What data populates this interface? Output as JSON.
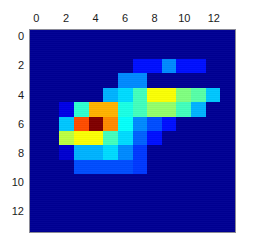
{
  "figure": {
    "background_color": "#ffffff",
    "axes_border_color": "#8a8a96",
    "tick_label_color": "#1b1b1b"
  },
  "axes": {
    "x_tick_labels": [
      "0",
      "2",
      "4",
      "6",
      "8",
      "10",
      "12"
    ],
    "x_tick_values": [
      0,
      2,
      4,
      6,
      8,
      10,
      12
    ],
    "x_tick_position": "top",
    "y_tick_labels": [
      "0",
      "2",
      "4",
      "6",
      "8",
      "10",
      "12"
    ],
    "y_tick_values": [
      0,
      2,
      4,
      6,
      8,
      10,
      12
    ],
    "y_tick_position": "left"
  },
  "chart_data": {
    "type": "heatmap",
    "title": "",
    "xlabel": "",
    "ylabel": "",
    "colormap": "jet",
    "origin": "upper",
    "grid": false,
    "legend": "none",
    "xlim": [
      -0.5,
      13.5
    ],
    "ylim": [
      13.5,
      -0.5
    ],
    "vmin": 0,
    "vmax": 1,
    "x": [
      0,
      1,
      2,
      3,
      4,
      5,
      6,
      7,
      8,
      9,
      10,
      11,
      12,
      13
    ],
    "y": [
      0,
      1,
      2,
      3,
      4,
      5,
      6,
      7,
      8,
      9,
      10,
      11,
      12,
      13
    ],
    "xtick_labels": [
      "0",
      "2",
      "4",
      "6",
      "8",
      "10",
      "12"
    ],
    "ytick_labels": [
      "0",
      "2",
      "4",
      "6",
      "8",
      "10",
      "12"
    ],
    "peak_cell": {
      "x": 4,
      "y": 6,
      "value": 1.0
    },
    "values": [
      [
        0.02,
        0.02,
        0.02,
        0.02,
        0.02,
        0.02,
        0.02,
        0.02,
        0.02,
        0.02,
        0.02,
        0.02,
        0.02,
        0.02
      ],
      [
        0.02,
        0.02,
        0.02,
        0.02,
        0.02,
        0.02,
        0.02,
        0.02,
        0.02,
        0.02,
        0.02,
        0.02,
        0.02,
        0.02
      ],
      [
        0.02,
        0.02,
        0.02,
        0.02,
        0.02,
        0.02,
        0.02,
        0.14,
        0.14,
        0.26,
        0.14,
        0.14,
        0.02,
        0.02
      ],
      [
        0.02,
        0.02,
        0.02,
        0.02,
        0.02,
        0.02,
        0.26,
        0.26,
        0.02,
        0.02,
        0.02,
        0.02,
        0.02,
        0.02
      ],
      [
        0.02,
        0.02,
        0.02,
        0.02,
        0.02,
        0.3,
        0.34,
        0.44,
        0.62,
        0.62,
        0.5,
        0.46,
        0.32,
        0.02
      ],
      [
        0.02,
        0.02,
        0.1,
        0.42,
        0.7,
        0.7,
        0.4,
        0.44,
        0.52,
        0.52,
        0.44,
        0.3,
        0.02,
        0.02
      ],
      [
        0.02,
        0.02,
        0.32,
        0.8,
        1.0,
        0.74,
        0.38,
        0.26,
        0.2,
        0.14,
        0.02,
        0.02,
        0.02,
        0.02
      ],
      [
        0.02,
        0.02,
        0.56,
        0.62,
        0.62,
        0.44,
        0.34,
        0.22,
        0.14,
        0.02,
        0.02,
        0.02,
        0.02,
        0.02
      ],
      [
        0.02,
        0.02,
        0.08,
        0.3,
        0.3,
        0.34,
        0.26,
        0.18,
        0.02,
        0.02,
        0.02,
        0.02,
        0.02,
        0.02
      ],
      [
        0.02,
        0.02,
        0.02,
        0.2,
        0.2,
        0.2,
        0.2,
        0.18,
        0.02,
        0.02,
        0.02,
        0.02,
        0.02,
        0.02
      ],
      [
        0.02,
        0.02,
        0.02,
        0.02,
        0.02,
        0.02,
        0.02,
        0.02,
        0.02,
        0.02,
        0.02,
        0.02,
        0.02,
        0.02
      ],
      [
        0.02,
        0.02,
        0.02,
        0.02,
        0.02,
        0.02,
        0.02,
        0.02,
        0.02,
        0.02,
        0.02,
        0.02,
        0.02,
        0.02
      ],
      [
        0.02,
        0.02,
        0.02,
        0.02,
        0.02,
        0.02,
        0.02,
        0.02,
        0.02,
        0.02,
        0.02,
        0.02,
        0.02,
        0.02
      ],
      [
        0.02,
        0.02,
        0.02,
        0.02,
        0.02,
        0.02,
        0.02,
        0.02,
        0.02,
        0.02,
        0.02,
        0.02,
        0.02,
        0.02
      ]
    ]
  }
}
